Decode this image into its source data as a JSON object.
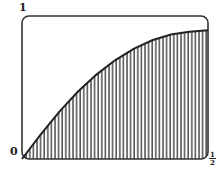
{
  "chart_data": {
    "type": "area",
    "title": "",
    "xlabel": "",
    "ylabel": "",
    "x_ticks": [
      "0",
      "1/2"
    ],
    "y_ticks": [
      "1"
    ],
    "xlim": [
      0,
      0.5
    ],
    "ylim": [
      0,
      1
    ],
    "grid": false,
    "fill": "vertical hatching under curve",
    "series": [
      {
        "name": "curve",
        "x": [
          0,
          0.05,
          0.1,
          0.15,
          0.2,
          0.25,
          0.3,
          0.35,
          0.4,
          0.45,
          0.5
        ],
        "y": [
          0,
          0.17,
          0.33,
          0.47,
          0.59,
          0.69,
          0.77,
          0.83,
          0.87,
          0.89,
          0.9
        ]
      }
    ]
  },
  "labels": {
    "y_top": "1",
    "origin": "0",
    "x_end_num": "1",
    "x_end_den": "2"
  }
}
